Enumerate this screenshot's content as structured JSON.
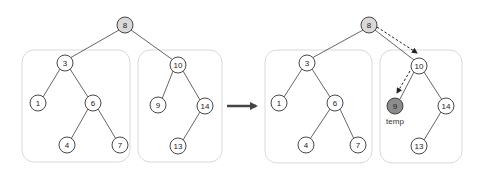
{
  "diagram": {
    "type": "binary-search-tree-transformation",
    "colors": {
      "node_fill": "#ffffff",
      "root_fill": "#d9d9d9",
      "temp_fill": "#8c8c8c",
      "edge": "#555555",
      "box_border": "#d9d9d9",
      "arrow": "#444444"
    },
    "before": {
      "root": "8",
      "left_subtree": {
        "nodes": [
          "3",
          "1",
          "6",
          "4",
          "7"
        ]
      },
      "right_subtree": {
        "nodes": [
          "10",
          "9",
          "14",
          "13"
        ]
      }
    },
    "transition_arrow": "right-arrow",
    "after": {
      "root": "8",
      "left_subtree": {
        "nodes": [
          "3",
          "1",
          "6",
          "4",
          "7"
        ]
      },
      "right_subtree": {
        "nodes": [
          "10",
          "9",
          "14",
          "13"
        ]
      },
      "highlighted_node": "9",
      "highlight_label": "temp",
      "traversal_path": [
        "8",
        "10",
        "9"
      ]
    }
  },
  "nodes": {
    "l8": "8",
    "l3": "3",
    "l1": "1",
    "l6": "6",
    "l4": "4",
    "l7": "7",
    "l10": "10",
    "l9": "9",
    "l14": "14",
    "l13": "13",
    "r8": "8",
    "r3": "3",
    "r1": "1",
    "r6": "6",
    "r4": "4",
    "r7": "7",
    "r10": "10",
    "r9": "9",
    "r14": "14",
    "r13": "13"
  },
  "labels": {
    "temp": "temp"
  }
}
